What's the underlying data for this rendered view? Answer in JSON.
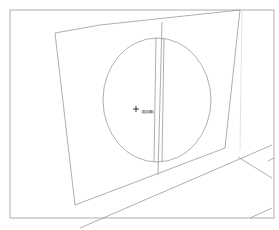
{
  "viewport": {
    "background": "#ffffff",
    "line_color": "#8c8c8c",
    "frame_color": "#999999"
  },
  "cursor": {
    "icon": "crosshair-plus-icon",
    "position": [
      136,
      109
    ],
    "inference_label": "端点/圆心"
  }
}
